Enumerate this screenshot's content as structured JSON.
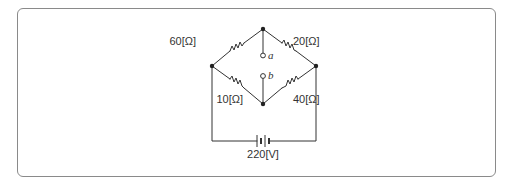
{
  "diagram": {
    "type": "wheatstone-bridge-circuit",
    "resistors": {
      "top_left": {
        "label": "60[Ω]",
        "value": 60,
        "unit": "Ω"
      },
      "top_right": {
        "label": "20[Ω]",
        "value": 20,
        "unit": "Ω"
      },
      "bottom_left": {
        "label": "10[Ω]",
        "value": 10,
        "unit": "Ω"
      },
      "bottom_right": {
        "label": "40[Ω]",
        "value": 40,
        "unit": "Ω"
      }
    },
    "terminals": {
      "a": {
        "label": "a"
      },
      "b": {
        "label": "b"
      }
    },
    "source": {
      "label": "220[V]",
      "value": 220,
      "unit": "V"
    },
    "colors": {
      "wire": "#333333",
      "frame": "#8a8a8a",
      "background": "#ffffff"
    }
  }
}
